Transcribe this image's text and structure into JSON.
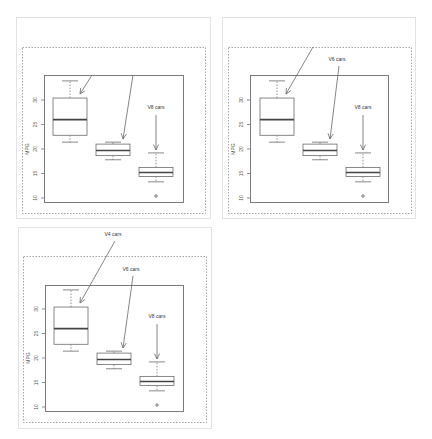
{
  "chart_data": [
    {
      "type": "box",
      "panel": 1,
      "title": "",
      "xlabel": "",
      "ylabel": "MPG",
      "yticks": [
        10,
        15,
        20,
        25,
        30
      ],
      "ylim": [
        10,
        34
      ],
      "grid": false,
      "categories": [
        "V4 cars",
        "V6 cars",
        "V8 cars"
      ],
      "boxes": [
        {
          "name": "V4 cars",
          "min": 21.4,
          "q1": 22.8,
          "median": 26.0,
          "q3": 30.4,
          "max": 33.9,
          "outliers": []
        },
        {
          "name": "V6 cars",
          "min": 17.8,
          "q1": 18.65,
          "median": 19.7,
          "q3": 21.0,
          "max": 21.4,
          "outliers": []
        },
        {
          "name": "V8 cars",
          "min": 13.3,
          "q1": 14.4,
          "median": 15.2,
          "q3": 16.25,
          "max": 19.2,
          "outliers": [
            10.4
          ]
        }
      ],
      "annotations": [
        {
          "text": "",
          "target": "V4 cars",
          "label_visible": false
        },
        {
          "text": "",
          "target": "V6 cars",
          "label_visible": false
        },
        {
          "text": "V8 cars",
          "target": "V8 cars",
          "label_visible": true
        }
      ]
    },
    {
      "type": "box",
      "panel": 2,
      "title": "",
      "xlabel": "",
      "ylabel": "MPG",
      "yticks": [
        10,
        15,
        20,
        25,
        30
      ],
      "ylim": [
        10,
        34
      ],
      "grid": false,
      "categories": [
        "V4 cars",
        "V6 cars",
        "V8 cars"
      ],
      "boxes": [
        {
          "name": "V4 cars",
          "min": 21.4,
          "q1": 22.8,
          "median": 26.0,
          "q3": 30.4,
          "max": 33.9,
          "outliers": []
        },
        {
          "name": "V6 cars",
          "min": 17.8,
          "q1": 18.65,
          "median": 19.7,
          "q3": 21.0,
          "max": 21.4,
          "outliers": []
        },
        {
          "name": "V8 cars",
          "min": 13.3,
          "q1": 14.4,
          "median": 15.2,
          "q3": 16.25,
          "max": 19.2,
          "outliers": [
            10.4
          ]
        }
      ],
      "annotations": [
        {
          "text": "",
          "target": "V4 cars",
          "label_visible": false
        },
        {
          "text": "V6 cars",
          "target": "V6 cars",
          "label_visible": true
        },
        {
          "text": "V8 cars",
          "target": "V8 cars",
          "label_visible": true
        }
      ]
    },
    {
      "type": "box",
      "panel": 3,
      "title": "",
      "xlabel": "",
      "ylabel": "MPG",
      "yticks": [
        10,
        15,
        20,
        25,
        30
      ],
      "ylim": [
        10,
        34
      ],
      "grid": false,
      "categories": [
        "V4 cars",
        "V6 cars",
        "V8 cars"
      ],
      "boxes": [
        {
          "name": "V4 cars",
          "min": 21.4,
          "q1": 22.8,
          "median": 26.0,
          "q3": 30.4,
          "max": 33.9,
          "outliers": []
        },
        {
          "name": "V6 cars",
          "min": 17.8,
          "q1": 18.65,
          "median": 19.7,
          "q3": 21.0,
          "max": 21.4,
          "outliers": []
        },
        {
          "name": "V8 cars",
          "min": 13.3,
          "q1": 14.4,
          "median": 15.2,
          "q3": 16.25,
          "max": 19.2,
          "outliers": [
            10.4
          ]
        }
      ],
      "annotations": [
        {
          "text": "V4 cars",
          "target": "V4 cars",
          "label_visible": true
        },
        {
          "text": "V6 cars",
          "target": "V6 cars",
          "label_visible": true
        },
        {
          "text": "V8 cars",
          "target": "V8 cars",
          "label_visible": true
        }
      ]
    }
  ],
  "labels": {
    "ylabel": "MPG",
    "v4": "V4 cars",
    "v6": "V6 cars",
    "v8": "V8 cars",
    "ticks": [
      "10",
      "15",
      "20",
      "25",
      "30"
    ]
  },
  "colors": {
    "frame": "#6e6e6e",
    "outer_border": "#e2e2e2",
    "median": "#444444"
  }
}
